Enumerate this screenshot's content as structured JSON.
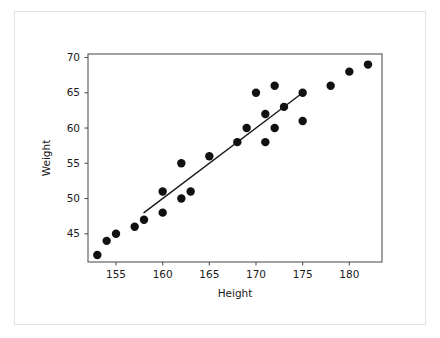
{
  "figure": {
    "background_color": "#ffffff",
    "card_border_color": "#e3e3e3",
    "axis_color": "#555555",
    "marker_color": "#111111",
    "line_color": "#1a1a1a"
  },
  "chart_data": {
    "type": "scatter",
    "title": "",
    "xlabel": "Height",
    "ylabel": "Weight",
    "xlim": [
      152,
      183.5
    ],
    "ylim": [
      41,
      70.5
    ],
    "grid": false,
    "legend": null,
    "xticks": [
      155,
      160,
      165,
      170,
      175,
      180
    ],
    "yticks": [
      45,
      50,
      55,
      60,
      65,
      70
    ],
    "xtick_labels": [
      "155",
      "160",
      "165",
      "170",
      "175",
      "180"
    ],
    "ytick_labels": [
      "45",
      "50",
      "55",
      "60",
      "65",
      "70"
    ],
    "x": [
      153,
      154,
      155,
      157,
      158,
      160,
      160,
      162,
      162,
      163,
      165,
      168,
      169,
      170,
      171,
      171,
      172,
      172,
      173,
      175,
      175,
      178,
      180,
      182
    ],
    "y": [
      42,
      44,
      45,
      46,
      47,
      48,
      51,
      50,
      55,
      51,
      56,
      58,
      60,
      65,
      58,
      62,
      60,
      66,
      63,
      61,
      65,
      66,
      68,
      69
    ],
    "points": [
      {
        "x": 153,
        "y": 42
      },
      {
        "x": 154,
        "y": 44
      },
      {
        "x": 155,
        "y": 45
      },
      {
        "x": 157,
        "y": 46
      },
      {
        "x": 158,
        "y": 47
      },
      {
        "x": 160,
        "y": 48
      },
      {
        "x": 160,
        "y": 51
      },
      {
        "x": 162,
        "y": 50
      },
      {
        "x": 162,
        "y": 55
      },
      {
        "x": 163,
        "y": 51
      },
      {
        "x": 165,
        "y": 56
      },
      {
        "x": 168,
        "y": 58
      },
      {
        "x": 169,
        "y": 60
      },
      {
        "x": 170,
        "y": 65
      },
      {
        "x": 171,
        "y": 58
      },
      {
        "x": 171,
        "y": 62
      },
      {
        "x": 172,
        "y": 60
      },
      {
        "x": 172,
        "y": 66
      },
      {
        "x": 173,
        "y": 63
      },
      {
        "x": 175,
        "y": 61
      },
      {
        "x": 175,
        "y": 65
      },
      {
        "x": 178,
        "y": 66
      },
      {
        "x": 180,
        "y": 68
      },
      {
        "x": 182,
        "y": 69
      }
    ],
    "marker_size": 4.2,
    "fit_line": {
      "type": "line",
      "x": [
        158,
        175
      ],
      "y": [
        48,
        65
      ]
    }
  }
}
